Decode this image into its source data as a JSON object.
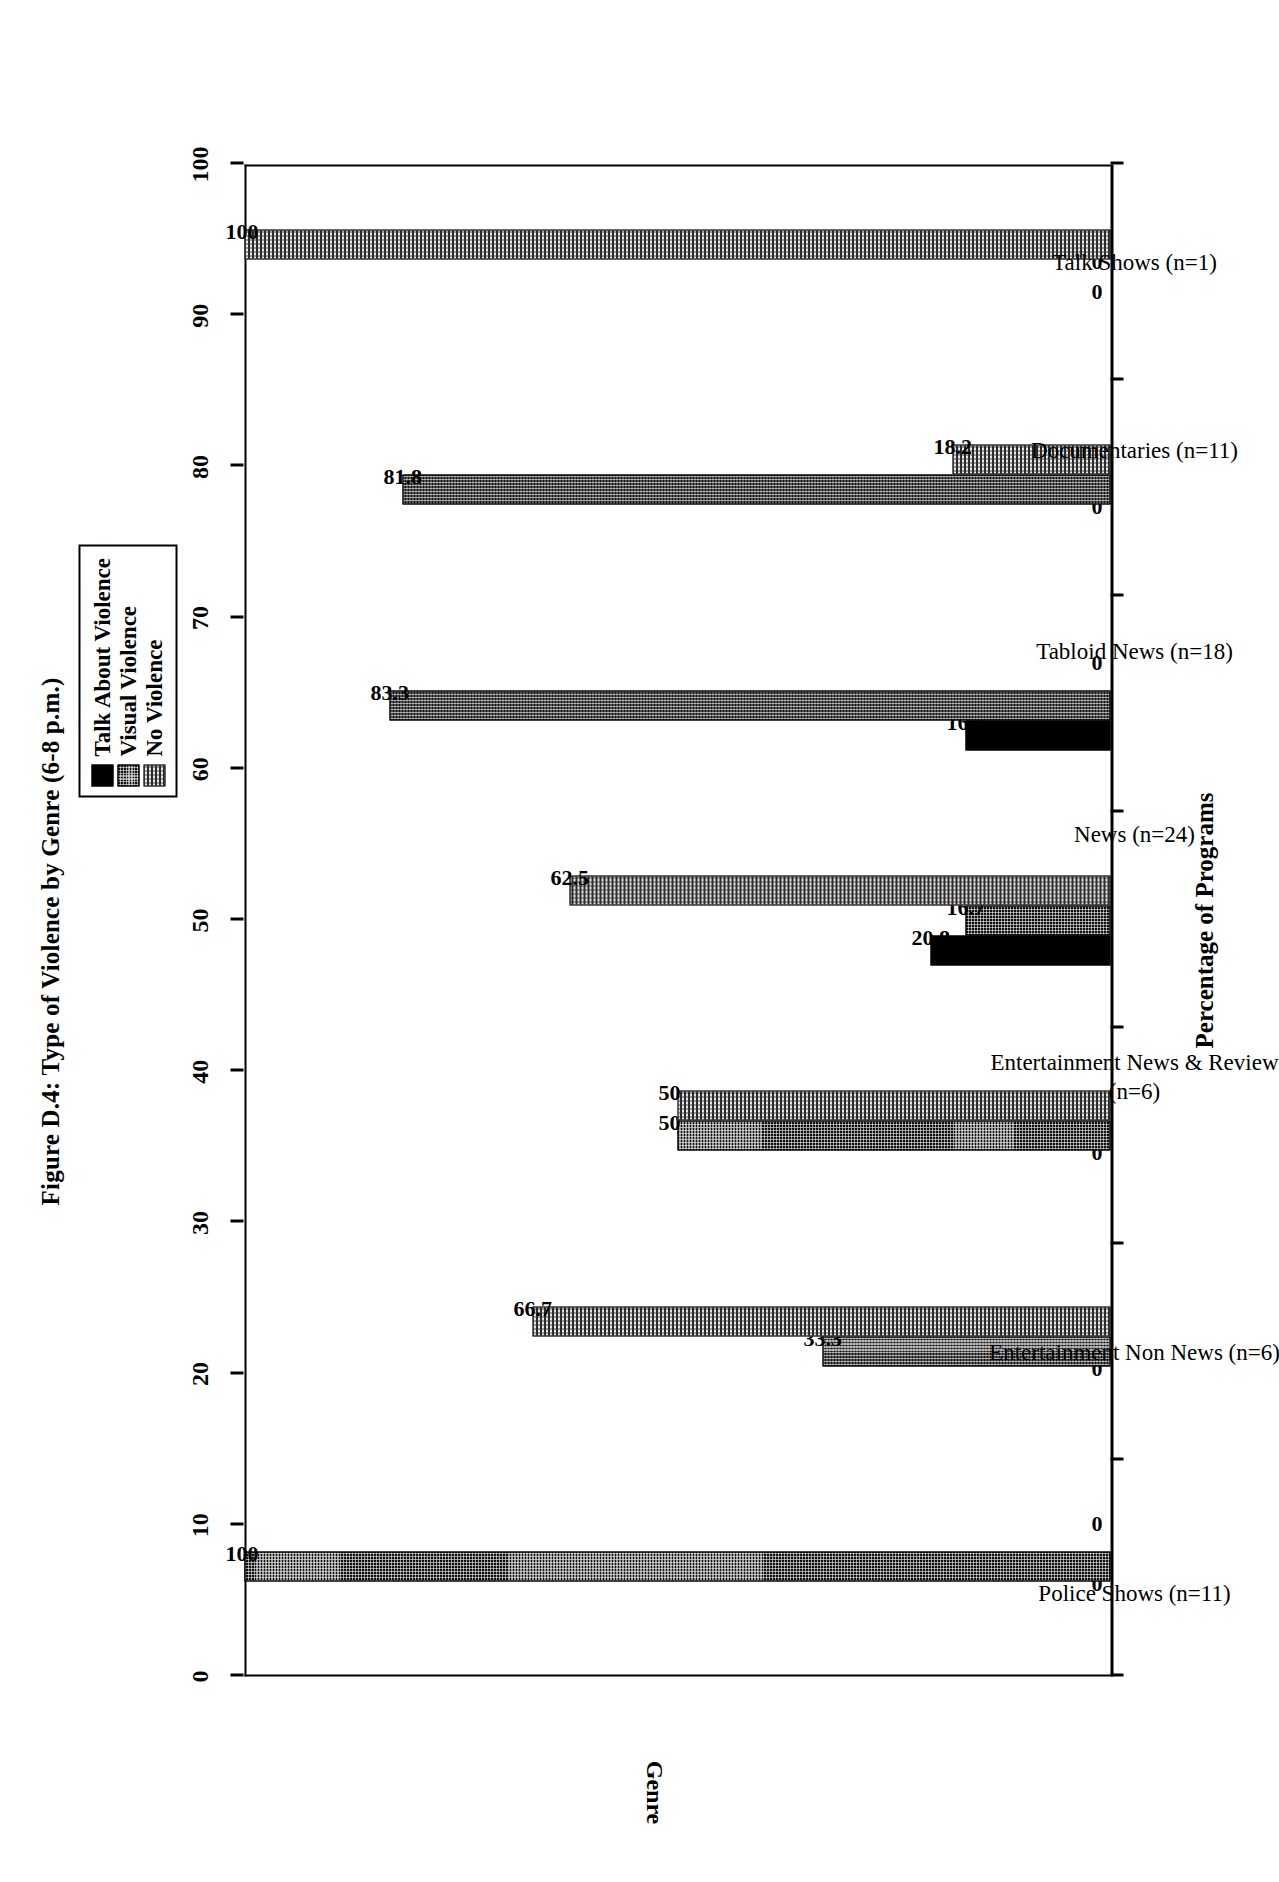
{
  "figure": {
    "title": "Figure D.4: Type of Violence by Genre (6-8 p.m.)"
  },
  "legend": {
    "items": [
      {
        "label": "Talk About Violence",
        "pattern": "solid-black",
        "color": "#000000"
      },
      {
        "label": "Visual Violence",
        "pattern": "dark-dotted",
        "color": "#111111"
      },
      {
        "label": "No Violence",
        "pattern": "light-checkered",
        "color": "#9b9b9b"
      }
    ]
  },
  "chart_data": {
    "type": "bar",
    "orientation": "vertical-rotated",
    "title": "Figure D.4: Type of Violence by Genre (6-8 p.m.)",
    "xlabel": "Genre",
    "ylabel": "Percentage of Programs",
    "ylim": [
      0,
      100
    ],
    "yticks": [
      0,
      10,
      20,
      30,
      40,
      50,
      60,
      70,
      80,
      90,
      100
    ],
    "ytick_labels": [
      "0",
      "10",
      "20",
      "30",
      "40",
      "50",
      "60",
      "70",
      "80",
      "90",
      "100"
    ],
    "grid": false,
    "legend_position": "top-right",
    "categories": [
      "Police Shows (n=11)",
      "Entertainment Non News (n=6)",
      "Entertainment News & Review\n(n=6)",
      "News (n=24)",
      "Tabloid News (n=18)",
      "Documentaries (n=11)",
      "Talk Shows (n=1)"
    ],
    "series": [
      {
        "name": "Talk About Violence",
        "values": [
          0,
          0,
          0,
          20.8,
          16.7,
          0,
          0
        ],
        "labels": [
          "0",
          "0",
          "0",
          "20.8",
          "16.7",
          "0",
          "0"
        ]
      },
      {
        "name": "Visual Violence",
        "values": [
          100,
          33.3,
          50,
          16.7,
          83.3,
          81.8,
          0
        ],
        "labels": [
          "100",
          "33.3",
          "50",
          "16.7",
          "83.3",
          "81.8",
          "0"
        ]
      },
      {
        "name": "No Violence",
        "values": [
          0,
          66.7,
          50,
          62.5,
          0,
          18.2,
          100
        ],
        "labels": [
          "0",
          "66.7",
          "50",
          "62.5",
          "0",
          "18.2",
          "100"
        ]
      }
    ]
  }
}
